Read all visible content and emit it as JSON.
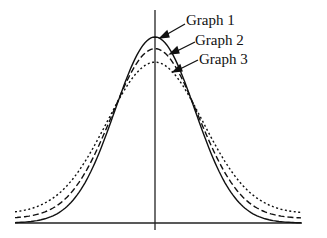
{
  "chart_data": {
    "type": "line",
    "title": "",
    "xlabel": "",
    "ylabel": "",
    "grid": false,
    "legend_position": "annotations with arrows near peak (top right of center)",
    "series": [
      {
        "name": "Graph 1",
        "style": "solid",
        "peak": 1.0,
        "sigma": 1.0
      },
      {
        "name": "Graph 2",
        "style": "dashed",
        "peak": 0.94,
        "sigma": 1.08
      },
      {
        "name": "Graph 3",
        "style": "dotted",
        "peak": 0.87,
        "sigma": 1.2
      }
    ],
    "annotations": [
      "Graph 1",
      "Graph 2",
      "Graph 3"
    ]
  },
  "labels": {
    "g1": "Graph 1",
    "g2": "Graph 2",
    "g3": "Graph 3"
  }
}
